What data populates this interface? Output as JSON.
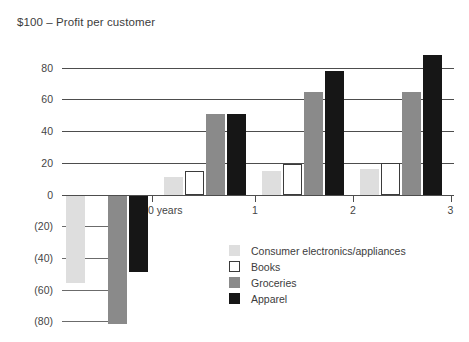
{
  "chart_data": {
    "type": "bar",
    "title": "$100 – Profit per customer",
    "xlabel": "",
    "ylabel": "",
    "categories": [
      "0 years",
      "1",
      "2",
      "3"
    ],
    "tick_labels_x": [
      "0 years",
      "1",
      "2",
      "3"
    ],
    "tick_labels_y": [
      "80",
      "60",
      "40",
      "20",
      "0",
      "(20)",
      "(40)",
      "(60)",
      "(80)"
    ],
    "ytick_values": [
      80,
      60,
      40,
      20,
      0,
      -20,
      -40,
      -60,
      -80
    ],
    "ylim": [
      -88,
      95
    ],
    "grid": "horizontal",
    "legend_position": "center-bottom",
    "series": [
      {
        "name": "Consumer electronics/appliances",
        "color": "#dedede",
        "values": [
          -56,
          11,
          15,
          16
        ]
      },
      {
        "name": "Books",
        "color": "#ffffff",
        "values": [
          null,
          15,
          19,
          20
        ]
      },
      {
        "name": "Groceries",
        "color": "#8a8a8a",
        "values": [
          -82,
          51,
          65,
          65
        ]
      },
      {
        "name": "Apparel",
        "color": "#161616",
        "values": [
          -49,
          51,
          78,
          88
        ]
      }
    ]
  }
}
